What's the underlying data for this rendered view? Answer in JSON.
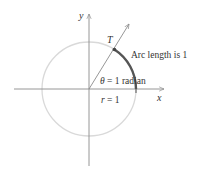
{
  "diagram": {
    "labels": {
      "y_axis": "y",
      "x_axis": "x",
      "point": "T",
      "arc": "Arc length is 1",
      "angle_theta": "θ",
      "angle_rest": " = 1 radian",
      "radius_r": "r",
      "radius_rest": " = 1"
    },
    "colors": {
      "circle": "#d9d9d9",
      "axis": "#8a8a8a",
      "arc": "#555555",
      "text": "#333333"
    },
    "geometry": {
      "center": [
        89,
        89
      ],
      "radius": 47,
      "angle_radians": 1
    }
  }
}
